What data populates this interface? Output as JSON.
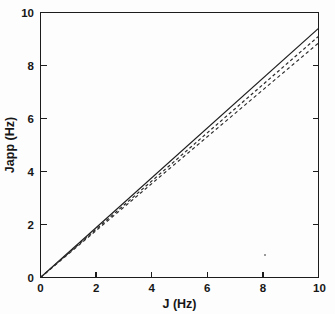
{
  "chart_data": {
    "type": "line",
    "title": "",
    "xlabel": "J (Hz)",
    "ylabel": "Japp (Hz)",
    "xlim": [
      0,
      10
    ],
    "ylim": [
      0,
      10
    ],
    "xticks": [
      0,
      2,
      4,
      6,
      8,
      10
    ],
    "yticks": [
      0,
      2,
      4,
      6,
      8,
      10
    ],
    "xtick_labels": [
      "0",
      "2",
      "4",
      "6",
      "8",
      "10"
    ],
    "ytick_labels": [
      "0",
      "2",
      "4",
      "6",
      "8",
      "10"
    ],
    "grid": false,
    "legend": "none",
    "series": [
      {
        "name": "solid",
        "style": "solid",
        "color": "#1d1d1d",
        "x": [
          0,
          10
        ],
        "values": [
          0,
          9.4
        ],
        "slope": 0.94
      },
      {
        "name": "dashed-upper",
        "style": "dashed",
        "color": "#2a2a2a",
        "x": [
          0,
          10
        ],
        "values": [
          0,
          9.1
        ],
        "slope": 0.91
      },
      {
        "name": "dashed-lower",
        "style": "dashed",
        "color": "#2a2a2a",
        "x": [
          0,
          10
        ],
        "values": [
          0,
          8.85
        ],
        "slope": 0.885
      }
    ]
  },
  "axes": {
    "x_title": "J (Hz)",
    "y_title": "Japp (Hz)",
    "x_labels": [
      "0",
      "2",
      "4",
      "6",
      "8",
      "10"
    ],
    "y_labels": [
      "0",
      "2",
      "4",
      "6",
      "8",
      "10"
    ]
  },
  "colors": {
    "ink": "#1c1c1c",
    "background": "#fdfdfd",
    "speck": "#9a9a9a"
  }
}
